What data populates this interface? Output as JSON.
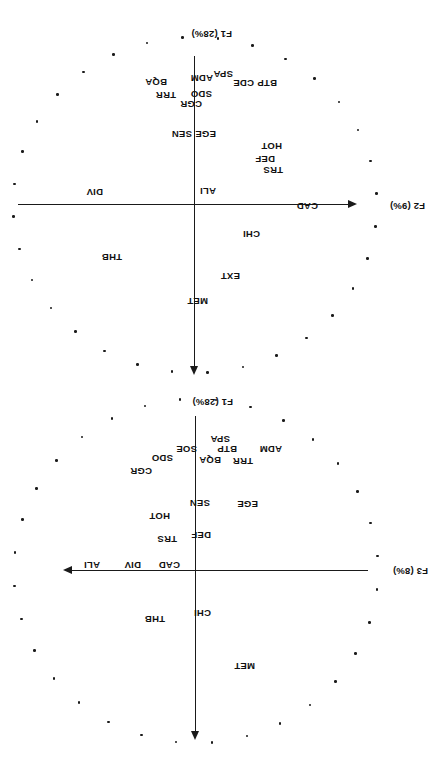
{
  "figure": {
    "kind": "pca-correlation-circle-pair",
    "orientation": "rotated-180",
    "ink_color": "#1a1a1a",
    "background": "#ffffff"
  },
  "chart_data": [
    {
      "type": "scatter",
      "title": "",
      "subtitle": "",
      "xlabel": "F3 (8%)",
      "ylabel": "F1 (28%)",
      "xlim": [
        -1,
        1
      ],
      "ylim": [
        -1,
        1
      ],
      "grid": false,
      "legend": "none",
      "axis_style": "arrowed-crosshair",
      "annotations": [
        "Correlation circle of unit radius drawn as a ring of marker dots",
        "Variable labels placed at their loading coordinates"
      ],
      "circle": {
        "radius": 1.0,
        "n_marker_dots": 32,
        "marker": "dot"
      },
      "points": [
        {
          "label": "MET",
          "x": -0.22,
          "y": 0.55
        },
        {
          "label": "THB",
          "x": 0.23,
          "y": 0.32
        },
        {
          "label": "CHI",
          "x": -0.03,
          "y": 0.15
        },
        {
          "label": "CAD",
          "x": 0.09,
          "y": -0.02
        },
        {
          "label": "DIV",
          "x": 0.29,
          "y": -0.03
        },
        {
          "label": "ALI",
          "x": 0.48,
          "y": -0.03
        },
        {
          "label": "DEF",
          "x": -0.04,
          "y": -0.16
        },
        {
          "label": "TRS",
          "x": 0.11,
          "y": -0.14
        },
        {
          "label": "HOT",
          "x": 0.14,
          "y": -0.24
        },
        {
          "label": "SEN",
          "x": -0.04,
          "y": -0.28
        },
        {
          "label": "EGE",
          "x": -0.25,
          "y": -0.27
        },
        {
          "label": "CGR",
          "x": 0.25,
          "y": -0.39
        },
        {
          "label": "SDO",
          "x": 0.14,
          "y": -0.47
        },
        {
          "label": "SOE",
          "x": 0.08,
          "y": -0.5
        },
        {
          "label": "BQA",
          "x": -0.02,
          "y": -0.46
        },
        {
          "label": "TRR",
          "x": -0.14,
          "y": -0.45
        },
        {
          "label": "BTP",
          "x": -0.1,
          "y": -0.49
        },
        {
          "label": "SPA",
          "x": -0.07,
          "y": -0.53
        },
        {
          "label": "ADM",
          "x": -0.24,
          "y": -0.49
        }
      ]
    },
    {
      "type": "scatter",
      "title": "",
      "subtitle": "",
      "xlabel": "F2 (9%)",
      "ylabel": "F1 (28%)",
      "xlim": [
        -1,
        1
      ],
      "ylim": [
        -1,
        1
      ],
      "grid": false,
      "legend": "none",
      "axis_style": "arrowed-crosshair",
      "annotations": [
        "Correlation circle of unit radius drawn as a ring of marker dots",
        "Variable labels placed at their loading coordinates"
      ],
      "circle": {
        "radius": 1.0,
        "n_marker_dots": 32,
        "marker": "dot"
      },
      "points": [
        {
          "label": "MET",
          "x": 0.0,
          "y": 0.55
        },
        {
          "label": "EXT",
          "x": -0.13,
          "y": 0.42
        },
        {
          "label": "THB",
          "x": 0.25,
          "y": 0.31
        },
        {
          "label": "CHI",
          "x": -0.18,
          "y": 0.2
        },
        {
          "label": "CAD",
          "x": -0.42,
          "y": 0.0
        },
        {
          "label": "ALI",
          "x": -0.03,
          "y": -0.04
        },
        {
          "label": "DIV",
          "x": 0.29,
          "y": -0.05
        },
        {
          "label": "TRS",
          "x": -0.28,
          "y": -0.15
        },
        {
          "label": "DEF",
          "x": -0.23,
          "y": -0.19
        },
        {
          "label": "HOT",
          "x": -0.28,
          "y": -0.24
        },
        {
          "label": "SEN",
          "x": 0.02,
          "y": -0.27
        },
        {
          "label": "EGE",
          "x": -0.06,
          "y": -0.27
        },
        {
          "label": "CGR",
          "x": -0.01,
          "y": -0.38
        },
        {
          "label": "SDO",
          "x": -0.06,
          "y": -0.42
        },
        {
          "label": "TRR",
          "x": 0.08,
          "y": -0.42
        },
        {
          "label": "BQA",
          "x": 0.11,
          "y": -0.47
        },
        {
          "label": "ADM",
          "x": -0.06,
          "y": -0.48
        },
        {
          "label": "SPA",
          "x": -0.12,
          "y": -0.5
        },
        {
          "label": "CDE",
          "x": -0.2,
          "y": -0.46
        },
        {
          "label": "BTP",
          "x": -0.28,
          "y": -0.46
        }
      ]
    }
  ],
  "panel_f1f3": {
    "x_axis_label": "F3 (8%)",
    "y_axis_label": "F1 (28%)",
    "labels": [
      {
        "text": "MET",
        "left": 183,
        "top": 88
      },
      {
        "text": "THB",
        "left": 273,
        "top": 135
      },
      {
        "text": "CHI",
        "left": 227,
        "top": 141
      },
      {
        "text": "CAD",
        "left": 258,
        "top": 189
      },
      {
        "text": "DIV",
        "left": 297,
        "top": 189
      },
      {
        "text": "ALI",
        "left": 338,
        "top": 189
      },
      {
        "text": "DEF",
        "left": 227,
        "top": 219
      },
      {
        "text": "TRS",
        "left": 261,
        "top": 215
      },
      {
        "text": "HOT",
        "left": 268,
        "top": 238
      },
      {
        "text": "SEN",
        "left": 228,
        "top": 251
      },
      {
        "text": "EGE",
        "left": 180,
        "top": 250
      },
      {
        "text": "CGR",
        "left": 286,
        "top": 283
      },
      {
        "text": "SDO",
        "left": 265,
        "top": 296
      },
      {
        "text": "SOE",
        "left": 241,
        "top": 305
      },
      {
        "text": "BQA",
        "left": 217,
        "top": 294
      },
      {
        "text": "TRR",
        "left": 185,
        "top": 293
      },
      {
        "text": "BTP",
        "left": 201,
        "top": 305
      },
      {
        "text": "SPA",
        "left": 208,
        "top": 315
      },
      {
        "text": "ADM",
        "left": 156,
        "top": 305
      }
    ]
  },
  "panel_f1f2": {
    "x_axis_label": "F2 (9%)",
    "y_axis_label": "F1 (28%)",
    "labels": [
      {
        "text": "MET",
        "left": 230,
        "top": 453
      },
      {
        "text": "EXT",
        "left": 198,
        "top": 478
      },
      {
        "text": "THB",
        "left": 316,
        "top": 497
      },
      {
        "text": "CHI",
        "left": 178,
        "top": 520
      },
      {
        "text": "CAD",
        "left": 120,
        "top": 548
      },
      {
        "text": "ALI",
        "left": 222,
        "top": 563
      },
      {
        "text": "DIV",
        "left": 335,
        "top": 562
      },
      {
        "text": "TRS",
        "left": 155,
        "top": 584
      },
      {
        "text": "DEF",
        "left": 163,
        "top": 595
      },
      {
        "text": "HOT",
        "left": 156,
        "top": 608
      },
      {
        "text": "SEN",
        "left": 246,
        "top": 620
      },
      {
        "text": "EGE",
        "left": 222,
        "top": 620
      },
      {
        "text": "CGR",
        "left": 236,
        "top": 650
      },
      {
        "text": "SDO",
        "left": 226,
        "top": 660
      },
      {
        "text": "TRR",
        "left": 262,
        "top": 659
      },
      {
        "text": "BQA",
        "left": 271,
        "top": 672
      },
      {
        "text": "ADM",
        "left": 225,
        "top": 676
      },
      {
        "text": "SPA",
        "left": 205,
        "top": 680
      },
      {
        "text": "CDE",
        "left": 184,
        "top": 671
      },
      {
        "text": "BTP",
        "left": 161,
        "top": 671
      }
    ]
  }
}
